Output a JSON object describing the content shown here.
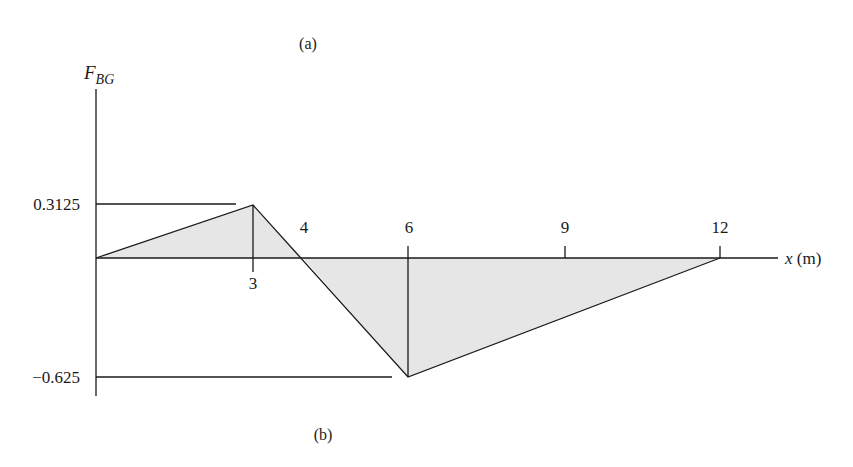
{
  "figure": {
    "caption_top": "(a)",
    "caption_bottom": "(b)"
  },
  "chart_data": {
    "type": "line",
    "ylabel": "F",
    "ylabel_subscript": "BG",
    "xlabel": "x (m)",
    "x": [
      0,
      3,
      4,
      6,
      12
    ],
    "y": [
      0,
      0.3125,
      0,
      -0.625,
      0
    ],
    "x_tick_labels": [
      "3",
      "4",
      "6",
      "9",
      "12"
    ],
    "y_tick_labels": [
      "0.3125",
      "−0.625"
    ],
    "xlim": [
      0,
      12
    ],
    "ylim": [
      -0.625,
      0.3125
    ],
    "shaded_area": true,
    "grid": false,
    "legend": null
  },
  "colors": {
    "line": "#1a1a1a",
    "fill": "#e6e6e6",
    "background": "#ffffff"
  }
}
